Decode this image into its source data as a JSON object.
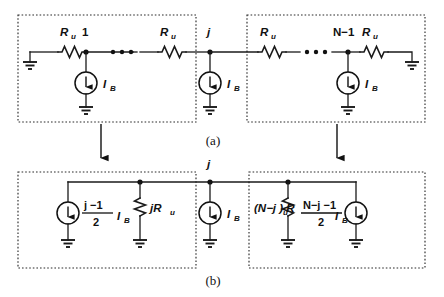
{
  "figure": {
    "captions": {
      "a": "(a)",
      "b": "(b)"
    }
  },
  "panel_a": {
    "left_box": {
      "resistor_left_label": "R",
      "resistor_left_sub": "u",
      "node_label": "1",
      "source_label": "I",
      "source_sub": "B",
      "resistor_right_label": "R",
      "resistor_right_sub": "u",
      "ellipsis": "• • •"
    },
    "center": {
      "node_label": "j",
      "source_label": "I",
      "source_sub": "B"
    },
    "right_box": {
      "resistor_left_label": "R",
      "resistor_left_sub": "u",
      "node_label": "N−1",
      "source_label": "I",
      "source_sub": "B",
      "resistor_right_label": "R",
      "resistor_right_sub": "u",
      "ellipsis": "• • •"
    }
  },
  "panel_b": {
    "left_box": {
      "source_numerator": "j −1",
      "source_denominator": "2",
      "source_label": "I",
      "source_sub": "B",
      "resistor_label": "jR",
      "resistor_sub": "u"
    },
    "center": {
      "node_label": "j",
      "source_label": "I",
      "source_sub": "B"
    },
    "right_box": {
      "resistor_label": "(N−j ) R",
      "resistor_sub": "u",
      "source_numerator": "N−j −1",
      "source_denominator": "2",
      "source_label": "I",
      "source_sub": "B"
    }
  },
  "colors": {
    "ink": "#111111",
    "box_stroke": "#2b2b2b",
    "background": "#ffffff"
  }
}
